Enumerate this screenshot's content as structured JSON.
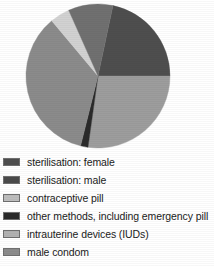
{
  "chart_data": {
    "type": "pie",
    "title": "",
    "subtitle": "",
    "xlabel": "",
    "ylabel": "",
    "grid": false,
    "legend_position": "bottom-left",
    "center": {
      "x": 98,
      "y": 76
    },
    "radius": 72,
    "clipped_top": true,
    "categories": [
      "sterilisation: female",
      "sterilisation: male",
      "contraceptive pill",
      "other methods, including emergency pill",
      "intrauterine devices (IUDs)",
      "male condom"
    ],
    "values": [
      22,
      8,
      27,
      2,
      4,
      37
    ],
    "slices": [
      {
        "label": "sterilisation: female",
        "value": 22,
        "color": "#4e4e4e",
        "start_angle_deg": 12,
        "end_angle_deg": 90
      },
      {
        "label": "contraceptive pill",
        "value": 27,
        "color": "#9d9d9d",
        "start_angle_deg": 90,
        "end_angle_deg": 188
      },
      {
        "label": "other methods, including emergency pill",
        "value": 2,
        "color": "#2a2a2a",
        "start_angle_deg": 188,
        "end_angle_deg": 194
      },
      {
        "label": "male condom",
        "value": 37,
        "color": "#8b8b8b",
        "start_angle_deg": 194,
        "end_angle_deg": 320
      },
      {
        "label": "intrauterine devices (IUDs)",
        "value": 4,
        "color": "#d2d2d2",
        "start_angle_deg": 320,
        "end_angle_deg": 336
      },
      {
        "label": "sterilisation: male",
        "value": 8,
        "color": "#707070",
        "start_angle_deg": 336,
        "end_angle_deg": 372
      }
    ]
  },
  "legend": {
    "items": [
      {
        "label": "sterilisation: female",
        "color": "#4e4e4e"
      },
      {
        "label": "sterilisation: male",
        "color": "#4a4a4a"
      },
      {
        "label": "contraceptive pill",
        "color": "#bdbdbd"
      },
      {
        "label": "other methods, including emergency pill",
        "color": "#2a2a2a"
      },
      {
        "label": "intrauterine devices (IUDs)",
        "color": "#b2b2b2"
      },
      {
        "label": "male condom",
        "color": "#8b8b8b"
      }
    ]
  }
}
